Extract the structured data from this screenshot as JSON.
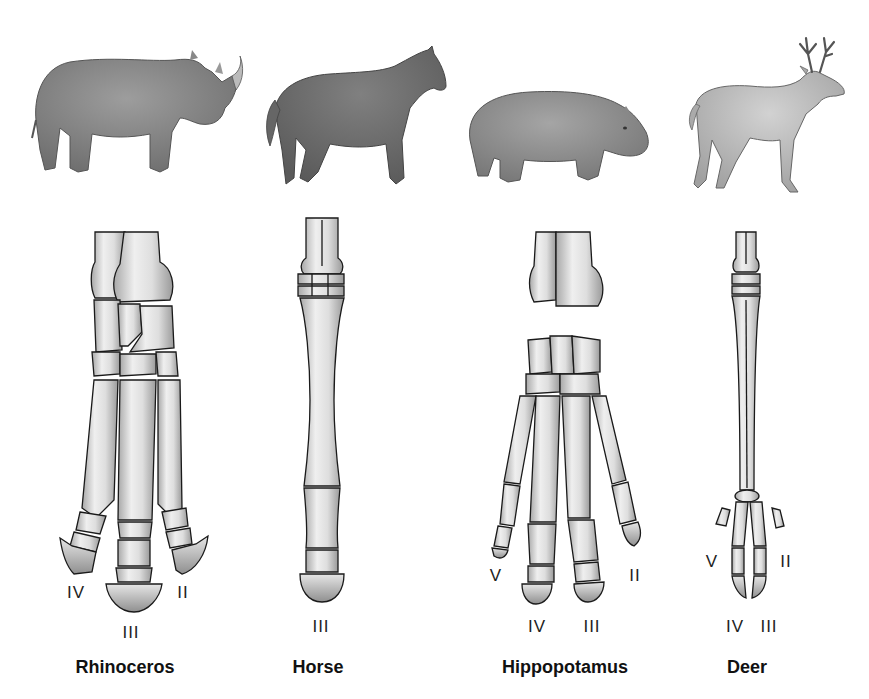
{
  "diagram": {
    "type": "comparative-anatomy",
    "colors": {
      "background": "#ffffff",
      "bone_fill": "#d9d9d9",
      "bone_highlight": "#f2f2f2",
      "bone_outline": "#1a1a1a",
      "animal_fill_dark": "#7a7a7a",
      "animal_fill_light": "#b0b0b0",
      "label_text": "#111111"
    },
    "animals": [
      {
        "name": "Rhinoceros",
        "illustration": "rhinoceros-icon",
        "digits_labeled": [
          "IV",
          "III",
          "II"
        ],
        "digit_count": 3
      },
      {
        "name": "Horse",
        "illustration": "horse-icon",
        "digits_labeled": [
          "III"
        ],
        "digit_count": 1
      },
      {
        "name": "Hippopotamus",
        "illustration": "hippopotamus-icon",
        "digits_labeled": [
          "V",
          "IV",
          "III",
          "II"
        ],
        "digit_count": 4
      },
      {
        "name": "Deer",
        "illustration": "deer-icon",
        "digits_labeled": [
          "V",
          "IV",
          "III",
          "II"
        ],
        "digit_count": 4
      }
    ],
    "labels": {
      "rhino": {
        "iv": "IV",
        "iii": "III",
        "ii": "II"
      },
      "horse": {
        "iii": "III"
      },
      "hippo": {
        "v": "V",
        "iv": "IV",
        "iii": "III",
        "ii": "II"
      },
      "deer": {
        "v": "V",
        "iv": "IV",
        "iii": "III",
        "ii": "II"
      }
    }
  }
}
